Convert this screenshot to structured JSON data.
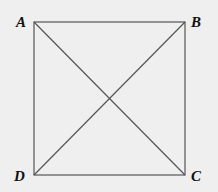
{
  "diagram": {
    "type": "square-with-diagonals",
    "vertices": [
      {
        "label": "A",
        "x": 34,
        "y": 22
      },
      {
        "label": "B",
        "x": 185,
        "y": 22
      },
      {
        "label": "C",
        "x": 185,
        "y": 175
      },
      {
        "label": "D",
        "x": 34,
        "y": 175
      }
    ],
    "line_color": "#555555",
    "background": "#efefef"
  }
}
